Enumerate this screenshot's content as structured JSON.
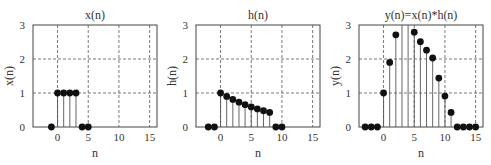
{
  "chart_data": [
    {
      "type": "stem",
      "title": "x(n)",
      "xlabel": "n",
      "ylabel": "x(n)",
      "xlim": [
        -4,
        16.2
      ],
      "ylim": [
        0,
        3
      ],
      "xticks": [
        0,
        5,
        10,
        15
      ],
      "yticks": [
        0,
        1,
        2,
        3
      ],
      "grid": true,
      "x": [
        -1,
        0,
        1,
        2,
        3,
        4,
        5
      ],
      "values": [
        0,
        1,
        1,
        1,
        1,
        0,
        0
      ]
    },
    {
      "type": "stem",
      "title": "h(n)",
      "xlabel": "n",
      "ylabel": "h(n)",
      "xlim": [
        -4,
        16.2
      ],
      "ylim": [
        0,
        3
      ],
      "xticks": [
        0,
        5,
        10,
        15
      ],
      "yticks": [
        0,
        1,
        2,
        3
      ],
      "grid": true,
      "x": [
        -2,
        -1,
        0,
        1,
        2,
        3,
        4,
        5,
        6,
        7,
        8,
        9,
        10
      ],
      "values": [
        0,
        0,
        1.0,
        0.9,
        0.81,
        0.729,
        0.656,
        0.59,
        0.531,
        0.478,
        0.43,
        0,
        0
      ]
    },
    {
      "type": "stem",
      "title": "y(n)=x(n)*h(n)",
      "xlabel": "n",
      "ylabel": "y(n)",
      "xlim": [
        -4,
        16.2
      ],
      "ylim": [
        0,
        3
      ],
      "xticks": [
        0,
        5,
        10,
        15
      ],
      "yticks": [
        0,
        1,
        2,
        3
      ],
      "grid": true,
      "x": [
        -3,
        -2,
        -1,
        0,
        1,
        2,
        3,
        4,
        5,
        6,
        7,
        8,
        9,
        10,
        11,
        12,
        13,
        14,
        15
      ],
      "values": [
        0,
        0,
        0,
        1.0,
        1.9,
        2.71,
        3.44,
        3.1,
        2.79,
        2.51,
        2.26,
        2.03,
        1.44,
        0.91,
        0.43,
        0,
        0,
        0,
        0
      ]
    }
  ],
  "panels": [
    {
      "title": "x(n)",
      "xlabel": "n",
      "ylabel": "x(n)"
    },
    {
      "title": "h(n)",
      "xlabel": "n",
      "ylabel": "h(n)"
    },
    {
      "title": "y(n)=x(n)*h(n)",
      "xlabel": "n",
      "ylabel": "y(n)"
    }
  ],
  "tick_labels": {
    "x": [
      "0",
      "5",
      "10",
      "15"
    ],
    "y": [
      "0",
      "1",
      "2",
      "3"
    ]
  }
}
